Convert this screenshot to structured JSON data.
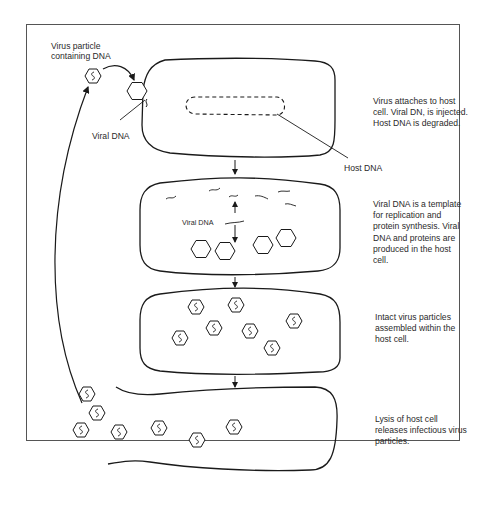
{
  "diagram": {
    "labels": {
      "virus_particle": "Virus particle\ncontaining DNA",
      "viral_dna_1": "Viral DNA",
      "host_dna": "Host DNA",
      "viral_dna_2": "Viral DNA"
    },
    "steps": [
      {
        "id": "attach",
        "text": "Virus attaches to host cell. Viral DN, is injected. Host DNA is degraded."
      },
      {
        "id": "replicate",
        "text": "Viral DNA is a template for replication and protein synthesis. Viral DNA and proteins are produced in the host cell."
      },
      {
        "id": "assemble",
        "text": "Intact virus particles assembled within the host cell."
      },
      {
        "id": "lysis",
        "text": "Lysis of host cell releases infectious virus particles."
      }
    ],
    "colors": {
      "stroke": "#1a1a1a",
      "frame": "#555555",
      "text": "#2a2a2a"
    }
  }
}
